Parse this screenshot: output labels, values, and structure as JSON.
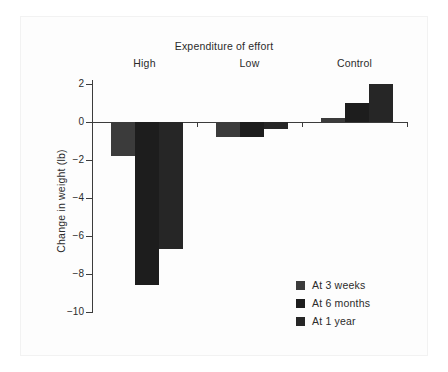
{
  "chart_data": {
    "type": "bar",
    "title": "Expenditure of effort",
    "xlabel": "",
    "ylabel": "Change in weight (lb)",
    "categories": [
      "High",
      "Low",
      "Control"
    ],
    "series": [
      {
        "name": "At 3 weeks",
        "color": "#3b3b3b",
        "values": [
          -1.8,
          -0.8,
          0.2
        ]
      },
      {
        "name": "At 6 months",
        "color": "#1d1d1d",
        "values": [
          -8.6,
          -0.8,
          1.0
        ]
      },
      {
        "name": "At 1 year",
        "color": "#262626",
        "values": [
          -6.7,
          -0.35,
          2.0
        ]
      }
    ],
    "ylim": [
      -10,
      2
    ],
    "yticks": [
      2,
      0,
      -2,
      -4,
      -6,
      -8,
      -10
    ],
    "ytick_labels": [
      "2",
      "0",
      "-2",
      "-4",
      "-6",
      "-8",
      "-10"
    ],
    "grid": false,
    "legend_position": "lower-right",
    "legend_entries": [
      "At 3 weeks",
      "At 6 months",
      "At 1 year"
    ]
  },
  "colors": {
    "axis": "#3c3c3c",
    "text": "#2b2b2b",
    "background": "#ffffff",
    "page": "#fdfdfd"
  }
}
